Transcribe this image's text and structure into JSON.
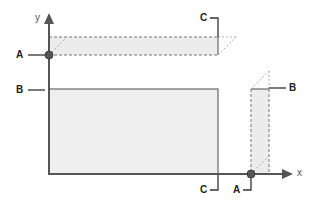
{
  "diagram": {
    "axes": {
      "x_label": "x",
      "y_label": "y"
    },
    "labels": {
      "left_A": "A",
      "left_B": "B",
      "top_C": "C",
      "right_B": "B",
      "bottom_C": "C",
      "bottom_A": "A"
    },
    "shapes": [
      {
        "name": "horizontal-strip",
        "description": "thin rectangle projected along y-axis at height A, width to C"
      },
      {
        "name": "large-rectangle",
        "description": "rectangle of height B and width C"
      },
      {
        "name": "vertical-strip",
        "description": "thin rectangle projected along x-axis at position A, height B"
      }
    ],
    "colors": {
      "axis": "#555555",
      "fill": "#efefef",
      "edge": "#666666",
      "dashed": "#888888",
      "point": "#555555"
    }
  }
}
